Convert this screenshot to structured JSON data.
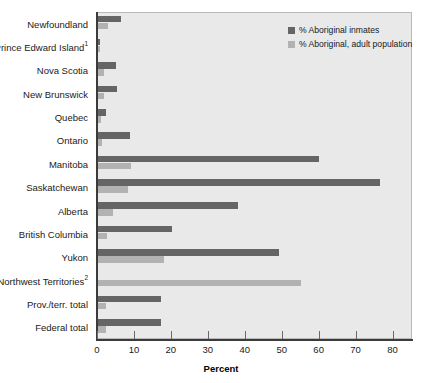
{
  "chart_data": {
    "type": "bar",
    "orientation": "horizontal",
    "title": "",
    "xlabel": "Percent",
    "ylabel": "",
    "xlim": [
      0,
      85
    ],
    "grid": false,
    "legend_position": "top-right",
    "xticks": [
      0,
      10,
      20,
      30,
      40,
      50,
      60,
      70,
      80
    ],
    "xtick_labels": [
      "0",
      "10",
      "20",
      "30",
      "40",
      "50",
      "60",
      "70",
      "80"
    ],
    "categories": [
      "Newfoundland",
      "Prince Edward Island",
      "Nova Scotia",
      "New Brunswick",
      "Quebec",
      "Ontario",
      "Manitoba",
      "Saskatchewan",
      "Alberta",
      "British Columbia",
      "Yukon",
      "Northwest Territories",
      "Prov./terr. total",
      "Federal total"
    ],
    "category_footnotes": [
      "",
      "1",
      "",
      "",
      "",
      "",
      "",
      "",
      "",
      "",
      "",
      "2",
      "",
      ""
    ],
    "series": [
      {
        "name": "% Aboriginal inmates",
        "color": "#656565",
        "values": [
          6.2,
          0.6,
          4.9,
          5.1,
          2.1,
          8.7,
          59.7,
          76.4,
          38.0,
          20.0,
          49.0,
          0.0,
          17.0,
          17.0
        ]
      },
      {
        "name": "% Aboriginal, adult population",
        "color": "#b2b2b2",
        "values": [
          2.8,
          0.5,
          1.5,
          1.6,
          0.8,
          1.2,
          9.0,
          8.0,
          4.0,
          2.5,
          18.0,
          55.0,
          2.2,
          2.2
        ]
      }
    ]
  },
  "legend": {
    "entries": [
      {
        "label": "% Aboriginal inmates"
      },
      {
        "label": "% Aboriginal, adult population"
      }
    ]
  },
  "axis": {
    "x_title": "Percent"
  },
  "colors": {
    "inmates": "#656565",
    "population": "#b2b2b2",
    "plot_background": "#e9e9e9",
    "axis": "#3b3b3b"
  }
}
